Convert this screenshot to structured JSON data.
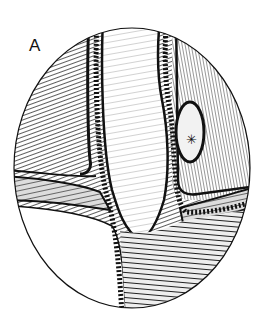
{
  "figure": {
    "panel_label": "A",
    "marker_symbol": "✳",
    "colors": {
      "ink": "#111111",
      "paper": "#ffffff",
      "tissue_hatch": "#555555",
      "light_tissue": "#dddddd"
    }
  }
}
